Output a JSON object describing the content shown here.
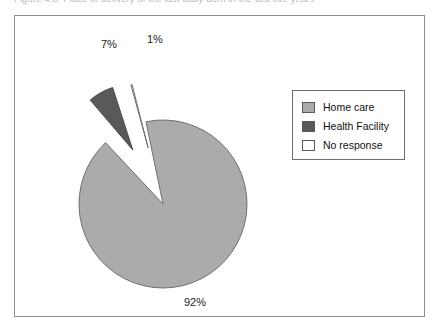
{
  "caption": {
    "text": "Figure 4.3: Place of delivery of the last baby born in the last five years"
  },
  "colors": {
    "home_care": "#ababab",
    "health_facility": "#595959",
    "no_response": "#ffffff",
    "outline": "#5a5a5a",
    "frame": "#8e8e8e",
    "text": "#1b1b1b"
  },
  "legend": {
    "items": [
      {
        "label": "Home care",
        "color": "#ababab"
      },
      {
        "label": "Health Facility",
        "color": "#595959"
      },
      {
        "label": "No response",
        "color": "#ffffff"
      }
    ]
  },
  "labels": {
    "home_care": "92%",
    "health_facility": "7%",
    "no_response": "1%"
  },
  "chart_data": {
    "type": "pie",
    "title": "",
    "xlabel": "",
    "ylabel": "",
    "categories": [
      "Home care",
      "Health Facility",
      "No response"
    ],
    "values": [
      92,
      7,
      1
    ],
    "value_labels": [
      "92%",
      "7%",
      "1%"
    ],
    "unit": "percent",
    "exploded": [
      "Health Facility",
      "No response"
    ],
    "legend_position": "right",
    "grid": false,
    "series": [
      {
        "name": "Place of delivery",
        "values": [
          92,
          7,
          1
        ]
      }
    ]
  }
}
